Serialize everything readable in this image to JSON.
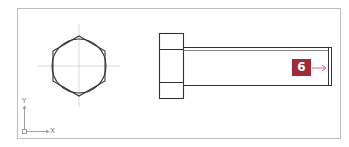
{
  "diagram": {
    "type": "cad-drawing",
    "views": [
      "front-view-hexagon",
      "side-view-bolt"
    ],
    "callout": {
      "label": "6",
      "color": "#9e2a3a",
      "arrow_color": "#d9707a"
    },
    "ucs": {
      "x_label": "X",
      "y_label": "Y"
    },
    "colors": {
      "frame": "#bdbdbd",
      "lines": "#333333",
      "centerlines": "#c8c8c8"
    }
  }
}
